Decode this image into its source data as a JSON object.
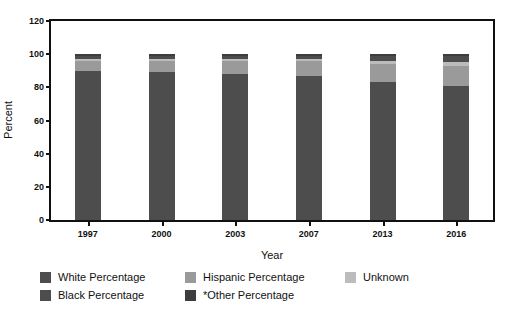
{
  "chart_data": {
    "type": "bar",
    "subtype": "stacked-bar",
    "title": "",
    "xlabel": "Year",
    "ylabel": "Percent",
    "categories": [
      "1997",
      "2000",
      "2003",
      "2007",
      "2013",
      "2016"
    ],
    "ylim": [
      0,
      120
    ],
    "yticks": [
      0,
      20,
      40,
      60,
      80,
      100,
      120
    ],
    "grid": false,
    "legend_position": "bottom",
    "stack_order_bottom_to_top": [
      "White Percentage",
      "Hispanic Percentage",
      "Unknown",
      "Black Percentage",
      "*Other Percentage"
    ],
    "series": [
      {
        "name": "White Percentage",
        "color": "#4d4d4d",
        "values": [
          90,
          89,
          88,
          87,
          83,
          81
        ]
      },
      {
        "name": "Hispanic Percentage",
        "color": "#9a9a9a",
        "values": [
          6,
          7,
          8,
          9,
          11,
          12
        ]
      },
      {
        "name": "Unknown",
        "color": "#bcbcbc",
        "values": [
          1,
          1,
          1,
          1,
          2,
          2
        ]
      },
      {
        "name": "Black Percentage",
        "color": "#4d4d4d",
        "values": [
          2,
          2,
          2,
          2,
          3,
          4
        ]
      },
      {
        "name": "*Other Percentage",
        "color": "#3d3d3d",
        "values": [
          1,
          1,
          1,
          1,
          1,
          1
        ]
      }
    ],
    "totals": [
      100,
      100,
      100,
      100,
      100,
      100
    ]
  },
  "axis": {
    "y_label": "Percent",
    "x_label": "Year",
    "y_ticks": [
      "0",
      "20",
      "40",
      "60",
      "80",
      "100",
      "120"
    ],
    "x_ticks": [
      "1997",
      "2000",
      "2003",
      "2007",
      "2013",
      "2016"
    ]
  },
  "legend": {
    "row1": [
      {
        "label": "White Percentage",
        "color": "#4d4d4d"
      },
      {
        "label": "Hispanic Percentage",
        "color": "#9a9a9a"
      },
      {
        "label": "Unknown",
        "color": "#bcbcbc"
      }
    ],
    "row2": [
      {
        "label": "Black Percentage",
        "color": "#4d4d4d"
      },
      {
        "label": "*Other Percentage",
        "color": "#3d3d3d"
      }
    ]
  },
  "colors": {
    "white_percentage": "#4d4d4d",
    "hispanic_percentage": "#9a9a9a",
    "unknown": "#bcbcbc",
    "black_percentage": "#4d4d4d",
    "other_percentage": "#3d3d3d",
    "axis": "#111111",
    "background": "#ffffff"
  }
}
